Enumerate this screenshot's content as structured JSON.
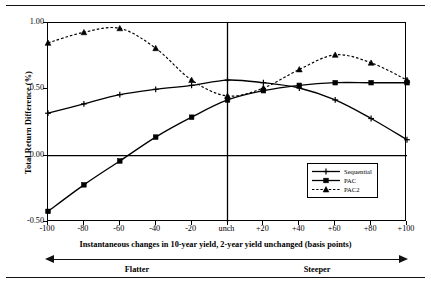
{
  "chart_data": {
    "type": "line",
    "title": "",
    "xlabel": "Instantaneous changes in 10-year yield, 2-year yield unchanged (basis points)",
    "ylabel": "Total Return Difference (%)",
    "x": [
      -100,
      -80,
      -60,
      -40,
      -20,
      0,
      20,
      40,
      60,
      80,
      100
    ],
    "xtick_labels": [
      "-100",
      "-80",
      "-60",
      "-40",
      "-20",
      "unch",
      "+20",
      "+40",
      "+60",
      "+80",
      "+100"
    ],
    "ytick_labels": [
      "1.00",
      "0.50",
      "0.00",
      "-0.50"
    ],
    "ytick_values": [
      1.0,
      0.5,
      0.0,
      -0.5
    ],
    "xlim": [
      -100,
      100
    ],
    "ylim": [
      -0.5,
      1.0
    ],
    "grid": false,
    "zero_line": true,
    "vertical_reference_line": 0,
    "legend_position": "lower right",
    "series": [
      {
        "name": "Sequential",
        "marker": "plus",
        "linestyle": "solid",
        "color": "#000000",
        "values": [
          0.32,
          0.39,
          0.46,
          0.5,
          0.53,
          0.57,
          0.55,
          0.51,
          0.42,
          0.28,
          0.12
        ]
      },
      {
        "name": "PAC",
        "marker": "square",
        "linestyle": "solid",
        "color": "#000000",
        "values": [
          -0.42,
          -0.22,
          -0.04,
          0.14,
          0.29,
          0.42,
          0.49,
          0.53,
          0.55,
          0.55,
          0.55
        ]
      },
      {
        "name": "PAC2",
        "marker": "triangle",
        "linestyle": "dashed",
        "color": "#000000",
        "values": [
          0.85,
          0.93,
          0.96,
          0.81,
          0.57,
          0.45,
          0.51,
          0.65,
          0.76,
          0.7,
          0.57
        ]
      }
    ]
  },
  "axis_annotations": {
    "left_direction": "Flatter",
    "right_direction": "Steeper"
  }
}
